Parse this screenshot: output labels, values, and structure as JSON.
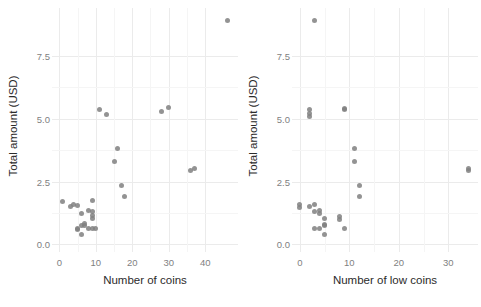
{
  "figure": {
    "background_color": "#ffffff",
    "point_color": "#808080",
    "grid_color": "#ebebeb",
    "tick_label_color": "#7f7f7f",
    "axis_label_color": "#2b2b2b"
  },
  "chart_data": [
    {
      "type": "scatter",
      "panel": "left",
      "title": "",
      "xlabel": "Number of coins",
      "ylabel": "Total amount (USD)",
      "xlim": [
        -2,
        49
      ],
      "ylim": [
        -0.3,
        9.4
      ],
      "xticks": [
        "0",
        "10",
        "20",
        "30",
        "40"
      ],
      "xtick_values": [
        0,
        10,
        20,
        30,
        40
      ],
      "yticks": [
        "0.0",
        "2.5",
        "5.0",
        "7.5"
      ],
      "ytick_values": [
        0.0,
        2.5,
        5.0,
        7.5
      ],
      "grid": true,
      "legend": "none",
      "x": [
        46,
        11,
        13,
        28,
        30,
        16,
        15,
        36,
        37,
        17,
        18,
        1,
        3,
        4,
        5,
        6,
        6,
        7,
        8,
        9,
        9,
        9,
        9,
        5,
        5,
        6,
        7,
        8,
        9,
        10
      ],
      "y": [
        8.9,
        5.35,
        5.15,
        5.3,
        5.45,
        3.8,
        3.3,
        2.95,
        3.0,
        2.35,
        1.9,
        1.7,
        1.5,
        1.6,
        1.55,
        1.25,
        0.75,
        0.75,
        1.35,
        1.75,
        1.3,
        1.15,
        1.05,
        0.65,
        0.6,
        0.4,
        0.85,
        0.65,
        0.65,
        0.65
      ]
    },
    {
      "type": "scatter",
      "panel": "right",
      "title": "",
      "xlabel": "Number of low coins",
      "ylabel": "Total amount (USD)",
      "xlim": [
        -1.6,
        36
      ],
      "ylim": [
        -0.3,
        9.4
      ],
      "xticks": [
        "0",
        "10",
        "20",
        "30"
      ],
      "xtick_values": [
        0,
        10,
        20,
        30
      ],
      "yticks": [
        "0.0",
        "2.5",
        "5.0",
        "7.5"
      ],
      "ytick_values": [
        0.0,
        2.5,
        5.0,
        7.5
      ],
      "grid": true,
      "legend": "none",
      "x": [
        3,
        2,
        2,
        2,
        9,
        9,
        34,
        34,
        11,
        11,
        12,
        12,
        0,
        0,
        2,
        3,
        3,
        4,
        4,
        5,
        5,
        5,
        8,
        8,
        9,
        4,
        3,
        5
      ],
      "y": [
        8.9,
        5.35,
        5.2,
        5.1,
        5.35,
        5.4,
        2.95,
        3.0,
        3.8,
        3.3,
        2.35,
        1.9,
        1.6,
        1.45,
        1.5,
        1.6,
        1.3,
        1.25,
        1.35,
        1.05,
        0.8,
        0.75,
        1.1,
        1.0,
        0.65,
        0.65,
        0.65,
        0.4
      ]
    }
  ]
}
